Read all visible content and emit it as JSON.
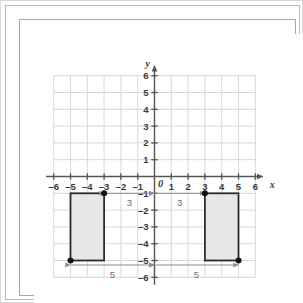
{
  "figure": {
    "axis_labels": {
      "x": "x",
      "y": "y",
      "origin": "0"
    },
    "x_ticks": [
      "-6",
      "-5",
      "-4",
      "-3",
      "-2",
      "-1",
      "1",
      "2",
      "3",
      "4",
      "5",
      "6"
    ],
    "y_ticks": [
      "6",
      "5",
      "4",
      "3",
      "2",
      "1",
      "-1",
      "-2",
      "-3",
      "-4",
      "-5",
      "-6"
    ],
    "colors": {
      "grid": "#d8d8d8",
      "axis": "#555555",
      "shape_fill": "#e7e7e7",
      "shape_stroke": "#2b2b2b",
      "point": "#111111",
      "dimension": "#8c8c8c",
      "label": "#3a3a3a",
      "dimension_label": "#6d6d6d",
      "background": "#ffffff"
    }
  },
  "chart_data": {
    "type": "scatter",
    "xlabel": "x",
    "ylabel": "y",
    "xlim": [
      -6,
      6
    ],
    "ylim": [
      -6,
      6
    ],
    "grid": true,
    "legend": "none",
    "x_tick_values": [
      -6,
      -5,
      -4,
      -3,
      -2,
      -1,
      0,
      1,
      2,
      3,
      4,
      5,
      6
    ],
    "y_tick_values": [
      -6,
      -5,
      -4,
      -3,
      -2,
      -1,
      0,
      1,
      2,
      3,
      4,
      5,
      6
    ],
    "shapes": [
      {
        "name": "left-rectangle",
        "kind": "rectangle",
        "x_range": [
          -5,
          -3
        ],
        "y_range": [
          -5,
          -1
        ],
        "width": 2,
        "height": 4,
        "fill": "#e7e7e7",
        "stroke": "#2b2b2b",
        "vertices": [
          [
            -5,
            -1
          ],
          [
            -3,
            -1
          ],
          [
            -3,
            -5
          ],
          [
            -5,
            -5
          ]
        ]
      },
      {
        "name": "right-rectangle",
        "kind": "rectangle",
        "x_range": [
          3,
          5
        ],
        "y_range": [
          -5,
          -1
        ],
        "width": 2,
        "height": 4,
        "fill": "#e7e7e7",
        "stroke": "#2b2b2b",
        "vertices": [
          [
            3,
            -1
          ],
          [
            5,
            -1
          ],
          [
            5,
            -5
          ],
          [
            3,
            -5
          ]
        ]
      }
    ],
    "marked_points": [
      {
        "name": "left-top-inner-point",
        "x": -3,
        "y": -1
      },
      {
        "name": "left-bottom-outer-point",
        "x": -5,
        "y": -5
      },
      {
        "name": "right-top-inner-point",
        "x": 3,
        "y": -1
      },
      {
        "name": "right-bottom-outer-point",
        "x": 5,
        "y": -5
      }
    ],
    "annotations": [
      {
        "name": "left-horizontal-distance-3",
        "label": "3",
        "value": 3,
        "from": [
          -3,
          -1
        ],
        "to": [
          0,
          -1
        ],
        "orientation": "horizontal",
        "arrow": "double"
      },
      {
        "name": "right-horizontal-distance-3",
        "label": "3",
        "value": 3,
        "from": [
          0,
          -1
        ],
        "to": [
          3,
          -1
        ],
        "orientation": "horizontal",
        "arrow": "double"
      },
      {
        "name": "left-horizontal-distance-5",
        "label": "5",
        "value": 5,
        "from": [
          -5,
          -5
        ],
        "to": [
          0,
          -5
        ],
        "orientation": "horizontal",
        "arrow": "double"
      },
      {
        "name": "right-horizontal-distance-5",
        "label": "5",
        "value": 5,
        "from": [
          0,
          -5
        ],
        "to": [
          5,
          -5
        ],
        "orientation": "horizontal",
        "arrow": "double"
      }
    ]
  }
}
